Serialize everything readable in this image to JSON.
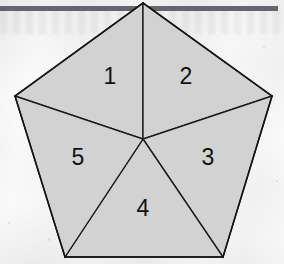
{
  "figure": {
    "shape": "regular-pentagon",
    "fill_color": "#d2d2d2",
    "stroke_color": "#1a1a1a",
    "background_color": "#fbfbfb",
    "top_bar_color": "#585c62",
    "regions": [
      {
        "id": "region-1",
        "label": "1",
        "position": "upper-left",
        "cx": 110,
        "cy": 77
      },
      {
        "id": "region-2",
        "label": "2",
        "position": "upper-right",
        "cx": 186,
        "cy": 77
      },
      {
        "id": "region-3",
        "label": "3",
        "position": "lower-right",
        "cx": 208,
        "cy": 158
      },
      {
        "id": "region-4",
        "label": "4",
        "position": "bottom",
        "cx": 143,
        "cy": 209
      },
      {
        "id": "region-5",
        "label": "5",
        "position": "lower-left",
        "cx": 78,
        "cy": 158
      }
    ],
    "vertices": {
      "top": {
        "x": 143,
        "y": 3
      },
      "right": {
        "x": 272,
        "y": 96
      },
      "bottom_right": {
        "x": 223,
        "y": 257
      },
      "bottom_left": {
        "x": 65,
        "y": 257
      },
      "left": {
        "x": 15,
        "y": 96
      },
      "center": {
        "x": 143,
        "y": 139
      }
    }
  }
}
